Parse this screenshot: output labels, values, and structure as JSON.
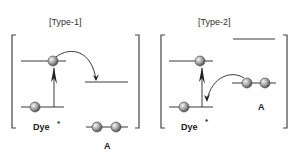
{
  "diagram": {
    "panels": [
      {
        "title": "[Type-1]",
        "dye_label": "Dye",
        "dye_superscript": "*",
        "acceptor_label": "A"
      },
      {
        "title": "[Type-2]",
        "dye_label": "Dye",
        "dye_superscript": "*",
        "acceptor_label": "A"
      }
    ],
    "colors": {
      "line": "#3a3a3a",
      "electron_fill_light": "#f2f2f2",
      "electron_fill_dark": "#6e6e6e"
    }
  }
}
